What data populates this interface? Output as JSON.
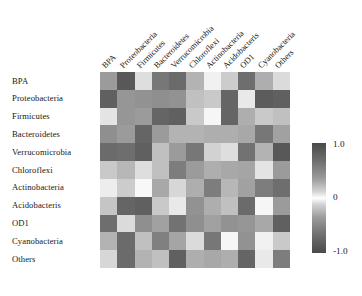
{
  "chart_data": {
    "type": "heatmap",
    "title": "",
    "xlabel": "",
    "ylabel": "",
    "x_categories": [
      "BPA",
      "Proteobacteria",
      "Firmicutes",
      "Bacteroidetes",
      "Verrucomicrobia",
      "Chloroflexi",
      "Actinobacteria",
      "Acidobacteris",
      "OD1",
      "Cyanobacteria",
      "Others"
    ],
    "y_categories": [
      "BPA",
      "Proteobacteria",
      "Firmicutes",
      "Bacteroidetes",
      "Verrucomicrobia",
      "Chloroflexi",
      "Actinobacteria",
      "Acidobacteris",
      "OD1",
      "Cyanobacteria",
      "Others"
    ],
    "colormap": "grayscale-diverging",
    "colorbar": {
      "position": "right",
      "ticks": [
        "1.0",
        "0",
        "-1.0"
      ],
      "vmin": -1.0,
      "vmax": 1.0
    },
    "zlim": [
      -1.0,
      1.0
    ],
    "grid": false,
    "legend": "colorbar-right",
    "values": [
      [
        0.55,
        0.92,
        0.18,
        0.75,
        0.82,
        0.42,
        0.08,
        0.28,
        0.8,
        0.45,
        0.2
      ],
      [
        0.88,
        0.58,
        0.6,
        0.62,
        0.6,
        0.35,
        0.3,
        0.85,
        0.12,
        0.9,
        0.88
      ],
      [
        0.15,
        0.58,
        0.55,
        0.85,
        0.88,
        0.3,
        0.05,
        0.85,
        0.45,
        0.3,
        0.35
      ],
      [
        0.62,
        0.55,
        0.85,
        0.55,
        0.42,
        0.42,
        0.45,
        0.45,
        0.48,
        0.75,
        0.52
      ],
      [
        0.82,
        0.8,
        0.88,
        0.35,
        0.55,
        0.75,
        0.25,
        0.18,
        0.78,
        0.42,
        0.92
      ],
      [
        0.3,
        0.4,
        0.18,
        0.35,
        0.72,
        0.55,
        0.45,
        0.48,
        0.5,
        0.15,
        0.55
      ],
      [
        0.1,
        0.28,
        0.04,
        0.48,
        0.22,
        0.45,
        0.72,
        0.4,
        0.52,
        0.72,
        0.8
      ],
      [
        0.32,
        0.85,
        0.88,
        0.3,
        0.12,
        0.6,
        0.45,
        0.35,
        0.82,
        0.05,
        0.55
      ],
      [
        0.8,
        0.2,
        0.62,
        0.52,
        0.78,
        0.62,
        0.52,
        0.6,
        0.58,
        0.48,
        0.88
      ],
      [
        0.42,
        0.82,
        0.35,
        0.7,
        0.5,
        0.2,
        0.75,
        0.05,
        0.6,
        0.08,
        0.3
      ],
      [
        0.22,
        0.82,
        0.42,
        0.35,
        0.88,
        0.45,
        0.48,
        0.45,
        0.85,
        0.12,
        0.72
      ]
    ]
  },
  "colorbar_labels": {
    "max": "1.0",
    "mid": "0",
    "min": "-1.0"
  }
}
